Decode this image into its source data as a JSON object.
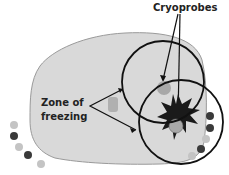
{
  "diagram": {
    "labels": {
      "cryoprobes": "Cryoprobes",
      "zone_line1": "Zone of",
      "zone_line2": "freezing"
    },
    "colors": {
      "organ_fill": "#d9d9d9",
      "organ_stroke": "#9a9a9a",
      "circle_stroke": "#111111",
      "probe_fill": "#a8a8a8",
      "star_fill": "#1a1a1a",
      "bead_light": "#c4c4c4",
      "bead_dark": "#3a3a3a"
    },
    "elements": {
      "freeze_zones": [
        {
          "cx": 163,
          "cy": 82,
          "r": 41
        },
        {
          "cx": 181,
          "cy": 122,
          "r": 42
        }
      ],
      "probes": [
        {
          "cx": 163,
          "cy": 92,
          "r": 7
        },
        {
          "cx": 176,
          "cy": 126,
          "r": 7
        }
      ],
      "beads_left": [
        "light",
        "dark",
        "light",
        "dark",
        "light"
      ],
      "beads_right": [
        "dark",
        "dark",
        "light",
        "dark",
        "light"
      ]
    }
  }
}
